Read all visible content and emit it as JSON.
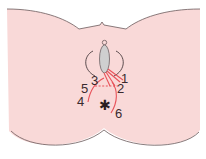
{
  "diagram": {
    "type": "anatomical-diagram",
    "colors": {
      "skin": "#f9d9d8",
      "outline": "#6b5a5c",
      "incision": "#e8525a",
      "opening_fill": "#cfcfcf",
      "opening_stroke": "#7a6e70",
      "label": "#3a2a2e",
      "background": "#ffffff"
    },
    "labels": [
      {
        "id": "1",
        "text": "1"
      },
      {
        "id": "2",
        "text": "2"
      },
      {
        "id": "3",
        "text": "3"
      },
      {
        "id": "4",
        "text": "4"
      },
      {
        "id": "5",
        "text": "5"
      },
      {
        "id": "6",
        "text": "6"
      }
    ],
    "markers": {
      "anus_symbol": "✱"
    }
  }
}
